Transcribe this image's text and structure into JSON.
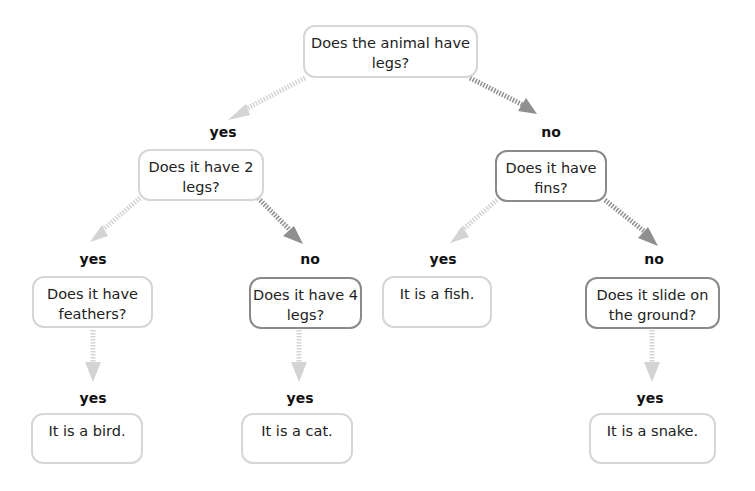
{
  "colors": {
    "yes_arrow": "#d4d4d4",
    "no_arrow": "#8f8f8f",
    "light_border": "#d6d6d6",
    "dark_border": "#8a8a8a"
  },
  "nodes": {
    "root": "Does the animal have legs?",
    "two_legs": "Does it have 2 legs?",
    "fins": "Does it have fins?",
    "feathers": "Does it have feathers?",
    "four_legs": "Does it have 4 legs?",
    "fish": "It is a fish.",
    "slide": "Does it slide on the ground?",
    "bird": "It is a bird.",
    "cat": "It is a cat.",
    "snake": "It is a snake."
  },
  "labels": {
    "root_yes": "yes",
    "root_no": "no",
    "two_legs_yes": "yes",
    "two_legs_no": "no",
    "fins_yes": "yes",
    "fins_no": "no",
    "feathers_yes": "yes",
    "four_legs_yes": "yes",
    "slide_yes": "yes"
  }
}
